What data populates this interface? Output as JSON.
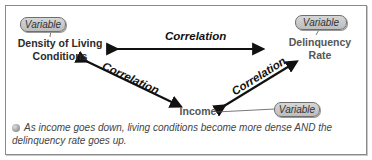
{
  "diagram": {
    "nodes": {
      "density": {
        "label_line1": "Density of Living",
        "label_line2": "Conditions",
        "tag": "Variable"
      },
      "delinquency": {
        "label_line1": "Delinquency",
        "label_line2": "Rate",
        "tag": "Variable"
      },
      "income": {
        "label": "Income",
        "tag": "Variable"
      }
    },
    "edges": {
      "top": "Correlation",
      "left": "Correlation",
      "right": "Correlation"
    },
    "note": "As income goes down, living conditions become more dense AND the delinquency rate goes up.",
    "colors": {
      "arrow": "#111111",
      "pill": "#c9c9c9",
      "text": "#333333"
    }
  }
}
